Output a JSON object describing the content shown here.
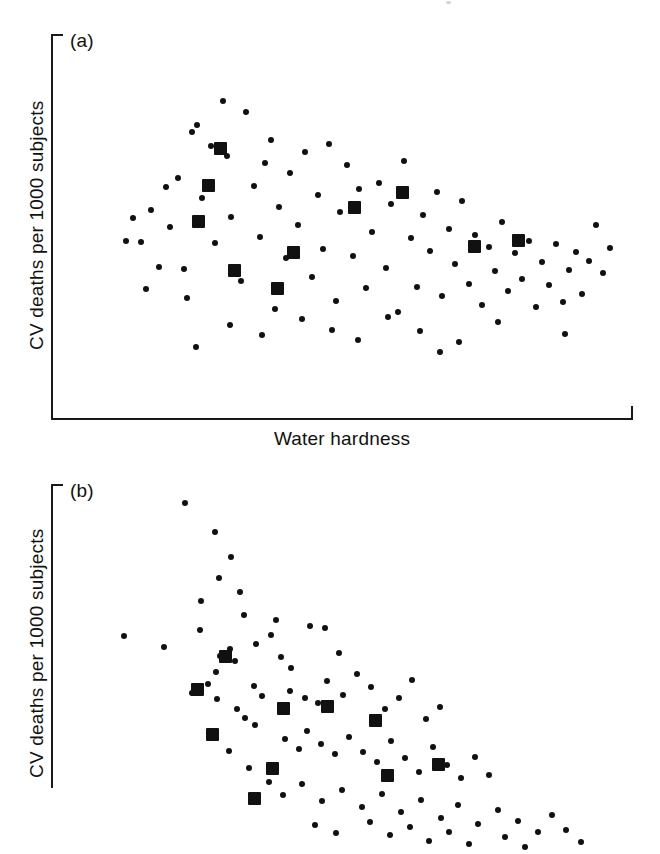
{
  "figure": {
    "background_color": "#ffffff",
    "ink_color": "#111111",
    "marker_small_label": "small-circle-marker",
    "marker_large_label": "large-square-marker"
  },
  "panels": [
    {
      "id": "a",
      "tag": "(a)",
      "ylabel": "CV deaths per 1000 subjects",
      "xlabel": "Water hardness",
      "xlabel_visible": true
    },
    {
      "id": "b",
      "tag": "(b)",
      "ylabel": "CV deaths per 1000 subjects",
      "xlabel": "",
      "xlabel_visible": false
    }
  ],
  "chart_data": [
    {
      "type": "scatter",
      "panel": "a",
      "title": "(a)",
      "xlabel": "Water hardness",
      "ylabel": "CV deaths per 1000 subjects",
      "xlim": [
        0,
        100
      ],
      "ylim": [
        0,
        100
      ],
      "grid": false,
      "legend": null,
      "axis_ticks": "none",
      "relationship": "no clear association between water hardness and CV deaths",
      "series": [
        {
          "name": "individual observations",
          "marker": "circle",
          "marker_size_px": 6,
          "points": [
            [
              21.9,
              62.5
            ],
            [
              25.1,
              76.2
            ],
            [
              27.5,
              70.9
            ],
            [
              29.6,
              82.5
            ],
            [
              30.2,
              68.1
            ],
            [
              31.0,
              52.3
            ],
            [
              20.5,
              49.8
            ],
            [
              22.8,
              38.9
            ],
            [
              24.3,
              74.6
            ],
            [
              26.0,
              57.2
            ],
            [
              28.1,
              45.5
            ],
            [
              23.4,
              31.2
            ],
            [
              33.5,
              79.8
            ],
            [
              34.8,
              60.4
            ],
            [
              35.9,
              47.1
            ],
            [
              36.7,
              66.3
            ],
            [
              32.6,
              35.8
            ],
            [
              37.8,
              72.5
            ],
            [
              39.2,
              55.0
            ],
            [
              40.3,
              41.6
            ],
            [
              41.1,
              63.8
            ],
            [
              38.5,
              28.3
            ],
            [
              42.4,
              50.2
            ],
            [
              43.6,
              69.4
            ],
            [
              44.8,
              36.7
            ],
            [
              45.9,
              58.1
            ],
            [
              46.7,
              44.0
            ],
            [
              47.8,
              71.3
            ],
            [
              48.9,
              30.5
            ],
            [
              49.7,
              53.6
            ],
            [
              50.8,
              65.9
            ],
            [
              51.9,
              42.3
            ],
            [
              53.0,
              59.7
            ],
            [
              54.2,
              33.9
            ],
            [
              55.1,
              48.4
            ],
            [
              56.3,
              61.2
            ],
            [
              57.5,
              39.1
            ],
            [
              58.4,
              55.8
            ],
            [
              59.6,
              27.6
            ],
            [
              60.7,
              67.0
            ],
            [
              61.8,
              46.9
            ],
            [
              62.9,
              34.2
            ],
            [
              64.0,
              52.8
            ],
            [
              65.2,
              43.5
            ],
            [
              66.3,
              58.9
            ],
            [
              67.1,
              31.8
            ],
            [
              68.3,
              49.3
            ],
            [
              69.5,
              40.1
            ],
            [
              70.6,
              56.4
            ],
            [
              71.8,
              35.0
            ],
            [
              72.9,
              47.7
            ],
            [
              74.0,
              29.4
            ],
            [
              75.2,
              44.6
            ],
            [
              76.3,
              38.2
            ],
            [
              77.5,
              51.1
            ],
            [
              78.6,
              33.0
            ],
            [
              79.8,
              42.9
            ],
            [
              81.0,
              36.1
            ],
            [
              82.1,
              46.0
            ],
            [
              83.3,
              28.9
            ],
            [
              84.4,
              40.7
            ],
            [
              85.6,
              34.6
            ],
            [
              86.7,
              45.2
            ],
            [
              87.9,
              30.1
            ],
            [
              89.0,
              38.5
            ],
            [
              90.2,
              43.1
            ],
            [
              91.3,
              32.4
            ],
            [
              92.5,
              41.0
            ],
            [
              15.4,
              45.9
            ],
            [
              17.2,
              54.2
            ],
            [
              18.6,
              39.3
            ],
            [
              19.8,
              60.1
            ],
            [
              93.7,
              50.3
            ],
            [
              94.8,
              37.8
            ],
            [
              96.0,
              44.4
            ],
            [
              12.9,
              46.2
            ],
            [
              14.1,
              52.0
            ],
            [
              16.3,
              33.7
            ],
            [
              30.8,
              24.1
            ],
            [
              36.2,
              21.5
            ],
            [
              43.1,
              25.8
            ],
            [
              48.3,
              23.0
            ],
            [
              52.7,
              20.4
            ],
            [
              57.9,
              26.3
            ],
            [
              63.4,
              22.7
            ],
            [
              70.1,
              19.8
            ],
            [
              76.8,
              24.9
            ],
            [
              24.9,
              18.6
            ],
            [
              88.4,
              21.9
            ],
            [
              66.9,
              17.3
            ]
          ]
        },
        {
          "name": "group means",
          "marker": "square",
          "marker_size_px": 13,
          "points": [
            [
              29.1,
              70.2
            ],
            [
              25.4,
              51.3
            ],
            [
              31.6,
              38.4
            ],
            [
              41.7,
              43.0
            ],
            [
              27.0,
              60.5
            ],
            [
              52.1,
              54.8
            ],
            [
              60.4,
              58.6
            ],
            [
              72.7,
              44.7
            ],
            [
              80.3,
              46.1
            ],
            [
              39.0,
              33.6
            ]
          ]
        }
      ]
    },
    {
      "type": "scatter",
      "panel": "b",
      "title": "(b)",
      "xlabel": "",
      "ylabel": "CV deaths per 1000 subjects",
      "xlim": [
        0,
        100
      ],
      "ylim": [
        0,
        100
      ],
      "grid": false,
      "legend": null,
      "axis_ticks": "none",
      "relationship": "strong negative association: CV deaths decrease as water hardness increases",
      "series": [
        {
          "name": "individual observations",
          "marker": "circle",
          "marker_size_px": 6,
          "points": [
            [
              23.0,
              95.0
            ],
            [
              28.1,
              87.5
            ],
            [
              31.0,
              81.0
            ],
            [
              28.9,
              75.5
            ],
            [
              32.4,
              72.0
            ],
            [
              25.8,
              69.5
            ],
            [
              33.2,
              66.0
            ],
            [
              38.6,
              64.5
            ],
            [
              25.6,
              62.0
            ],
            [
              35.2,
              58.4
            ],
            [
              30.8,
              57.0
            ],
            [
              29.0,
              55.2
            ],
            [
              31.6,
              53.8
            ],
            [
              28.4,
              51.0
            ],
            [
              12.6,
              60.4
            ],
            [
              19.4,
              57.5
            ],
            [
              37.8,
              60.8
            ],
            [
              39.6,
              54.9
            ],
            [
              44.5,
              63.0
            ],
            [
              41.2,
              52.0
            ],
            [
              47.0,
              62.5
            ],
            [
              49.5,
              56.0
            ],
            [
              26.9,
              48.0
            ],
            [
              24.2,
              45.5
            ],
            [
              28.6,
              44.0
            ],
            [
              34.8,
              47.5
            ],
            [
              36.2,
              44.8
            ],
            [
              32.0,
              41.5
            ],
            [
              33.4,
              39.0
            ],
            [
              35.0,
              37.2
            ],
            [
              41.0,
              46.0
            ],
            [
              43.6,
              44.2
            ],
            [
              45.9,
              43.0
            ],
            [
              47.4,
              48.8
            ],
            [
              50.2,
              45.0
            ],
            [
              52.6,
              50.6
            ],
            [
              55.0,
              47.2
            ],
            [
              57.4,
              41.5
            ],
            [
              59.8,
              44.4
            ],
            [
              62.0,
              49.0
            ],
            [
              64.4,
              38.8
            ],
            [
              66.8,
              42.0
            ],
            [
              40.2,
              33.5
            ],
            [
              42.6,
              31.0
            ],
            [
              44.0,
              35.6
            ],
            [
              46.4,
              32.4
            ],
            [
              48.8,
              29.8
            ],
            [
              51.2,
              34.0
            ],
            [
              53.6,
              30.2
            ],
            [
              56.0,
              27.5
            ],
            [
              58.4,
              33.0
            ],
            [
              60.8,
              28.6
            ],
            [
              63.2,
              25.0
            ],
            [
              65.6,
              31.4
            ],
            [
              68.0,
              26.8
            ],
            [
              70.4,
              23.5
            ],
            [
              72.8,
              29.0
            ],
            [
              75.2,
              24.2
            ],
            [
              30.6,
              30.5
            ],
            [
              34.0,
              26.0
            ],
            [
              37.4,
              22.5
            ],
            [
              39.8,
              19.0
            ],
            [
              43.2,
              21.8
            ],
            [
              46.6,
              17.5
            ],
            [
              50.0,
              20.4
            ],
            [
              53.4,
              16.0
            ],
            [
              56.8,
              19.2
            ],
            [
              60.2,
              14.5
            ],
            [
              63.6,
              17.8
            ],
            [
              67.0,
              13.0
            ],
            [
              70.0,
              16.4
            ],
            [
              73.4,
              11.5
            ],
            [
              76.8,
              15.0
            ],
            [
              80.2,
              12.2
            ],
            [
              83.6,
              9.5
            ],
            [
              86.0,
              13.8
            ],
            [
              54.8,
              12.0
            ],
            [
              58.2,
              8.5
            ],
            [
              61.6,
              10.8
            ],
            [
              65.0,
              7.0
            ],
            [
              68.4,
              9.4
            ],
            [
              71.8,
              6.2
            ],
            [
              49.0,
              9.0
            ],
            [
              45.4,
              11.2
            ],
            [
              78.0,
              8.0
            ],
            [
              81.4,
              5.5
            ],
            [
              88.5,
              10.0
            ],
            [
              91.0,
              6.8
            ]
          ]
        },
        {
          "name": "group means",
          "marker": "square",
          "marker_size_px": 13,
          "points": [
            [
              30.0,
              55.0
            ],
            [
              25.2,
              46.5
            ],
            [
              27.8,
              34.8
            ],
            [
              40.0,
              41.5
            ],
            [
              38.0,
              26.0
            ],
            [
              47.5,
              42.0
            ],
            [
              55.8,
              38.5
            ],
            [
              57.8,
              24.0
            ],
            [
              66.6,
              27.0
            ],
            [
              35.0,
              18.0
            ]
          ]
        }
      ]
    }
  ]
}
